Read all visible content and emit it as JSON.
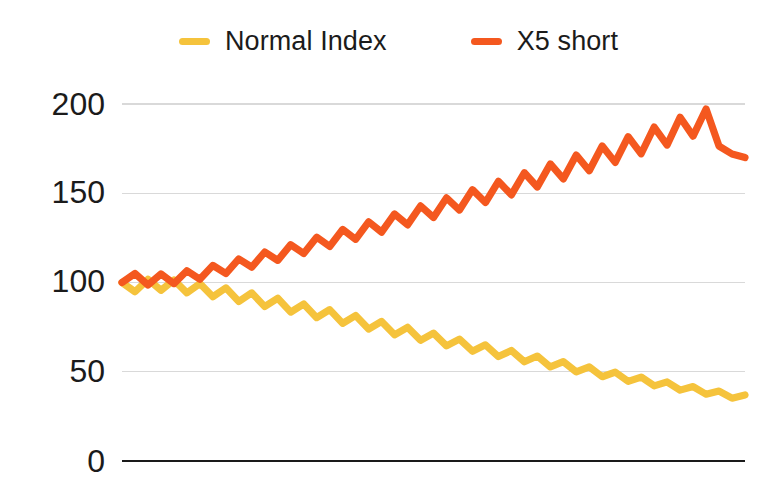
{
  "chart_data": {
    "type": "line",
    "title": "",
    "subtitle": "",
    "xlabel": "",
    "ylabel": "",
    "ylim": [
      0,
      215
    ],
    "xlim": [
      0,
      24
    ],
    "yticks": [
      0,
      50,
      100,
      150,
      200
    ],
    "ytick_labels": [
      "0",
      "50",
      "100",
      "150",
      "200"
    ],
    "xticks": [],
    "xtick_labels": [],
    "grid": "horizontal",
    "legend_position": "top-center",
    "background": "#ffffff",
    "series": [
      {
        "name": "Normal Index",
        "color": "#F5C33C",
        "values": [
          100.0,
          94.8,
          101.8,
          95.6,
          101.4,
          94.2,
          99.4,
          92.0,
          97.0,
          89.4,
          94.2,
          86.5,
          91.2,
          83.4,
          88.0,
          80.3,
          84.8,
          77.1,
          81.5,
          73.9,
          78.2,
          70.7,
          74.9,
          67.6,
          71.6,
          64.5,
          68.3,
          61.5,
          65.1,
          58.5,
          61.9,
          55.6,
          58.8,
          52.7,
          55.7,
          49.9,
          52.7,
          47.2,
          49.8,
          44.6,
          47.0,
          42.1,
          44.3,
          39.7,
          41.7,
          37.4,
          39.2,
          35.2,
          37.0
        ]
      },
      {
        "name": "X5 short",
        "color": "#F4581F",
        "values": [
          100.0,
          105.0,
          98.6,
          104.8,
          99.4,
          106.6,
          101.8,
          109.6,
          105.0,
          113.2,
          108.6,
          117.1,
          112.4,
          121.2,
          116.3,
          125.4,
          120.2,
          129.7,
          124.2,
          134.0,
          128.2,
          138.4,
          132.3,
          142.9,
          136.4,
          147.4,
          140.6,
          152.0,
          144.8,
          156.7,
          149.1,
          161.5,
          153.5,
          166.4,
          158.0,
          171.4,
          162.6,
          176.5,
          167.3,
          181.7,
          172.1,
          187.1,
          177.0,
          192.6,
          182.0,
          197.2,
          176.4,
          172.0,
          170.0
        ]
      }
    ]
  },
  "legend": {
    "items": [
      {
        "label": "Normal Index",
        "color": "#F5C33C",
        "marker": "line-swatch"
      },
      {
        "label": "X5 short",
        "color": "#F4581F",
        "marker": "line-swatch"
      }
    ]
  },
  "axis": {
    "y_labels": [
      "200",
      "150",
      "100",
      "50",
      "0"
    ]
  },
  "colors": {
    "normal_index": "#F5C33C",
    "x5_short": "#F4581F",
    "gridline": "#d9d9d9",
    "baseline": "#1a1a1a",
    "text": "#1b1b1b",
    "background": "#ffffff"
  }
}
